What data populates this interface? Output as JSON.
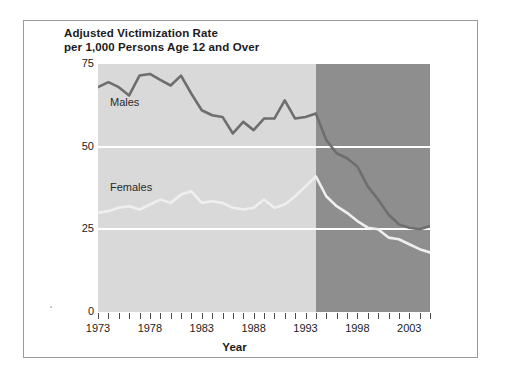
{
  "chart_data": {
    "type": "line",
    "title": "Adjusted Victimization Rate per 1,000 Persons Age 12 and Over",
    "title_line1": "Adjusted Victimization Rate",
    "title_line2": "per 1,000 Persons Age 12 and Over",
    "xlabel": "Year",
    "ylabel": "",
    "xlim": [
      1973,
      2005
    ],
    "ylim": [
      0,
      75
    ],
    "yticks": [
      0,
      25,
      50,
      75
    ],
    "ytick_labels": [
      "0",
      "25",
      "50",
      "75"
    ],
    "xticks": [
      1973,
      1974,
      1975,
      1976,
      1977,
      1978,
      1979,
      1980,
      1981,
      1982,
      1983,
      1984,
      1985,
      1986,
      1987,
      1988,
      1989,
      1990,
      1991,
      1992,
      1993,
      1994,
      1995,
      1996,
      1997,
      1998,
      1999,
      2000,
      2001,
      2002,
      2003,
      2004,
      2005
    ],
    "xtick_labels_shown": [
      "1973",
      "1978",
      "1983",
      "1988",
      "1993",
      "1998",
      "2003"
    ],
    "xtick_labels_shown_years": [
      1973,
      1978,
      1983,
      1988,
      1993,
      1998,
      2003
    ],
    "gridlines": {
      "horizontal": [
        25,
        50
      ],
      "color": "#ffffff"
    },
    "legend_position": "inline-on-plot",
    "plot_background_light": "#d9d9d9",
    "plot_background_dark": "#8e8e8e",
    "shaded_region_start_year": 1994,
    "x": [
      1973,
      1974,
      1975,
      1976,
      1977,
      1978,
      1979,
      1980,
      1981,
      1982,
      1983,
      1984,
      1985,
      1986,
      1987,
      1988,
      1989,
      1990,
      1991,
      1992,
      1993,
      1994,
      1995,
      1996,
      1997,
      1998,
      1999,
      2000,
      2001,
      2002,
      2003,
      2004,
      2005
    ],
    "series": [
      {
        "name": "Males",
        "color": "#6e6e6e",
        "label_text": "Males",
        "values": [
          68.0,
          69.5,
          68.0,
          65.5,
          71.5,
          72.0,
          70.2,
          68.5,
          71.5,
          66.0,
          61.0,
          59.5,
          59.0,
          54.0,
          57.5,
          55.0,
          58.5,
          58.5,
          64.0,
          58.5,
          59.0,
          60.0,
          52.0,
          48.0,
          46.5,
          44.0,
          38.0,
          34.0,
          29.5,
          26.5,
          25.5,
          25.0,
          26.0
        ]
      },
      {
        "name": "Females",
        "color": "#efefef",
        "label_text": "Females",
        "values": [
          30.0,
          30.5,
          31.5,
          32.0,
          31.0,
          32.5,
          34.0,
          33.0,
          35.5,
          36.5,
          33.0,
          33.5,
          33.0,
          31.5,
          31.0,
          31.5,
          34.0,
          31.5,
          32.5,
          35.0,
          38.0,
          41.0,
          35.0,
          32.0,
          30.0,
          27.5,
          25.5,
          25.0,
          22.5,
          22.0,
          20.5,
          19.0,
          18.0
        ]
      }
    ]
  },
  "series_labels": {
    "males": "Males",
    "females": "Females"
  }
}
